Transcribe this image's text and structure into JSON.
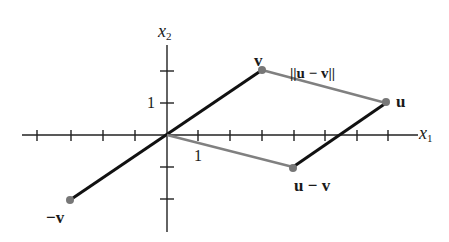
{
  "figure": {
    "axes": {
      "x_label": "x",
      "x_label_sub": "1",
      "y_label": "x",
      "y_label_sub": "2",
      "x_tick_label": "1",
      "y_tick_label": "1",
      "x_range": [
        -4,
        7
      ],
      "y_range": [
        -3,
        3
      ]
    },
    "points": {
      "v": {
        "label": "v",
        "coords": [
          3,
          2
        ]
      },
      "u": {
        "label": "u",
        "coords": [
          7,
          1
        ]
      },
      "u_minus_v": {
        "label": "u − v",
        "coords": [
          4,
          -1
        ]
      },
      "neg_v": {
        "label": "−v",
        "coords": [
          -3,
          -2
        ]
      }
    },
    "distance_label": "||u − v||",
    "colors": {
      "vector_line": "#111111",
      "distance_line": "#808080",
      "point": "#777777"
    }
  }
}
